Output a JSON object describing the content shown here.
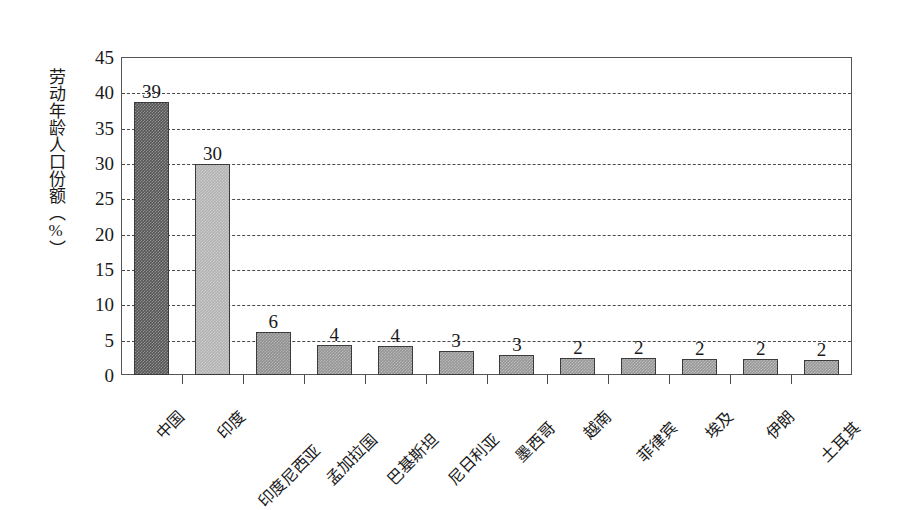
{
  "chart_data": {
    "type": "bar",
    "title": "",
    "subtitle": "",
    "xlabel": "",
    "ylabel": "劳动年龄人口份额（%）",
    "ylim": [
      0,
      45
    ],
    "yticks": [
      0,
      5,
      10,
      15,
      20,
      25,
      30,
      35,
      40,
      45
    ],
    "ytick_labels": [
      "0",
      "5",
      "10",
      "15",
      "20",
      "25",
      "30",
      "35",
      "40",
      "45"
    ],
    "grid": true,
    "grid_style": "dashed-horizontal",
    "legend": false,
    "legend_position": "none",
    "categories": [
      "中国",
      "印度",
      "印度尼西亚",
      "孟加拉国",
      "巴基斯坦",
      "尼日利亚",
      "墨西哥",
      "越南",
      "菲律宾",
      "埃及",
      "伊朗",
      "土耳其"
    ],
    "values": [
      38.6,
      29.8,
      6.1,
      4.3,
      4.1,
      3.4,
      2.8,
      2.4,
      2.4,
      2.2,
      2.2,
      2.1
    ],
    "data_labels": [
      "39",
      "30",
      "6",
      "4",
      "4",
      "3",
      "3",
      "2",
      "2",
      "2",
      "2",
      "2"
    ],
    "bar_colors": [
      "#565656",
      "#b2b2b2",
      "#8f8f8f",
      "#949494",
      "#949494",
      "#969696",
      "#969696",
      "#989898",
      "#989898",
      "#989898",
      "#989898",
      "#989898"
    ],
    "bar_edge_color": "#3b3b3b",
    "axis_color": "#555555",
    "grid_color": "#4a4a4a",
    "background_color": "#ffffff"
  }
}
